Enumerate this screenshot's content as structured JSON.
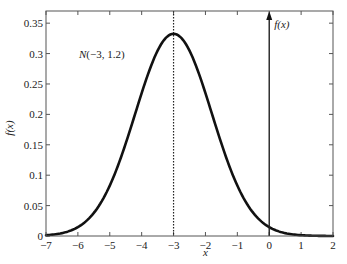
{
  "chart_data": {
    "type": "line",
    "title": "",
    "xlabel": "x",
    "ylabel": "f(x)",
    "xlim": [
      -7,
      2
    ],
    "ylim": [
      0,
      0.37
    ],
    "grid": false,
    "legend": null,
    "xticks": [
      -7,
      -6,
      -5,
      -4,
      -3,
      -2,
      -1,
      0,
      1,
      2
    ],
    "xtick_labels": [
      "−7",
      "−6",
      "−5",
      "−4",
      "−3",
      "−2",
      "−1",
      "0",
      "1",
      "2"
    ],
    "yticks": [
      0,
      0.05,
      0.1,
      0.15,
      0.2,
      0.25,
      0.3,
      0.35
    ],
    "ytick_labels": [
      "0",
      "0.05",
      "0.1",
      "0.15",
      "0.2",
      "0.25",
      "0.3",
      "0.35"
    ],
    "series": [
      {
        "name": "N(-3,1.2) normal density",
        "distribution": {
          "mean": -3,
          "sd": 1.2
        },
        "x": [
          -7,
          -6.5,
          -6,
          -5.5,
          -5,
          -4.5,
          -4,
          -3.5,
          -3,
          -2.5,
          -2,
          -1.5,
          -1,
          -0.5,
          0,
          0.5,
          1,
          1.5,
          2
        ],
        "values": [
          0.0013,
          0.0048,
          0.0146,
          0.0379,
          0.0829,
          0.1529,
          0.2366,
          0.3076,
          0.3324,
          0.3076,
          0.2366,
          0.1529,
          0.0829,
          0.0379,
          0.0146,
          0.0048,
          0.0013,
          0.0003,
          0.0001
        ]
      }
    ],
    "annotations": [
      {
        "text": "N(−3, 1.2)",
        "x": -4.6,
        "y": 0.3
      },
      {
        "text": "f(x)",
        "x": 0.1,
        "y": 0.355,
        "type": "axis-arrow-label"
      },
      {
        "type": "vline",
        "x": -3,
        "style": "dotted"
      },
      {
        "type": "vline-arrow",
        "x": 0,
        "style": "solid"
      }
    ]
  },
  "labels": {
    "annotation_n": "N(−3, 1.2)",
    "arrow_label": "f(x)",
    "xlabel": "x",
    "ylabel": "f(x)"
  }
}
